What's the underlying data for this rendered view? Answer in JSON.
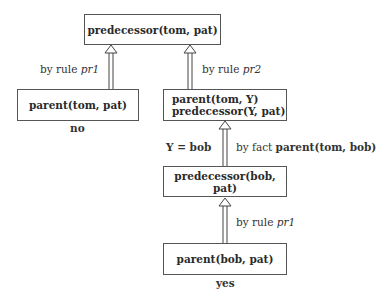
{
  "nodes": {
    "root": {
      "text": "predecessor(tom, pat)"
    },
    "left": {
      "text": "parent(tom, pat)",
      "result": "no"
    },
    "middle": {
      "line1": "parent(tom, Y)",
      "line2": "predecessor(Y, pat)"
    },
    "bob_goal": {
      "text": "predecessor(bob, pat)"
    },
    "bottom": {
      "text": "parent(bob, pat)",
      "result": "yes"
    }
  },
  "edges": {
    "left_rule": {
      "prefix": "by rule ",
      "rule": "pr1"
    },
    "right_rule": {
      "prefix": "by rule ",
      "rule": "pr2"
    },
    "fact": {
      "prefix": "by fact ",
      "fact": "parent(tom, bob)",
      "binding": "Y = bob"
    },
    "bottom_rule": {
      "prefix": "by rule ",
      "rule": "pr1"
    }
  }
}
